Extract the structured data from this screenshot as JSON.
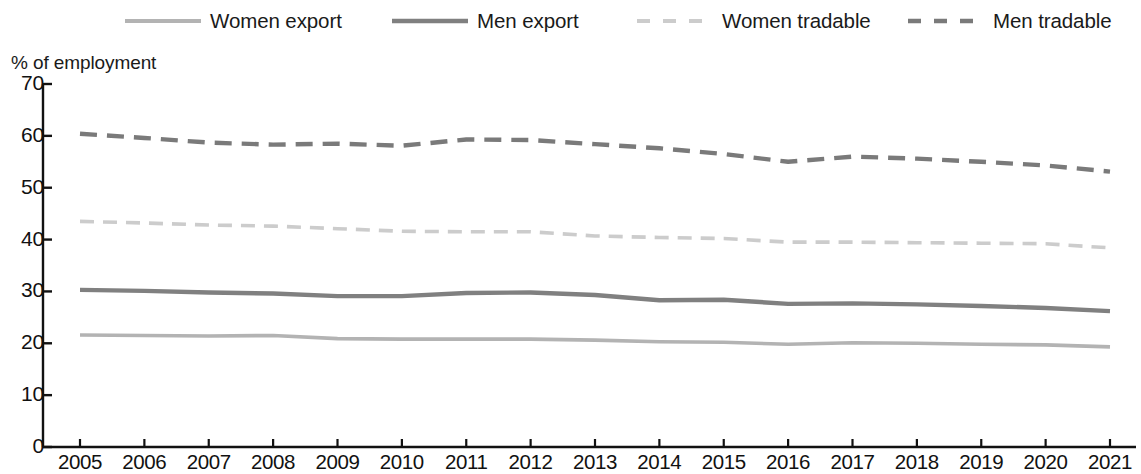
{
  "chart_data": {
    "type": "line",
    "title": "",
    "subtitle": "",
    "ylabel": "% of employment",
    "xlabel": "",
    "ylim": [
      0,
      70
    ],
    "yticks": [
      0,
      10,
      20,
      30,
      40,
      50,
      60,
      70
    ],
    "grid": false,
    "legend_position": "top",
    "x": [
      2005,
      2006,
      2007,
      2008,
      2009,
      2010,
      2011,
      2012,
      2013,
      2014,
      2015,
      2016,
      2017,
      2018,
      2019,
      2020,
      2021
    ],
    "categories": [
      "2005",
      "2006",
      "2007",
      "2008",
      "2009",
      "2010",
      "2011",
      "2012",
      "2013",
      "2014",
      "2015",
      "2016",
      "2017",
      "2018",
      "2019",
      "2020",
      "2021"
    ],
    "series": [
      {
        "name": "Women export",
        "style": "solid",
        "color": "#b3b3b3",
        "values": [
          21.6,
          21.5,
          21.4,
          21.5,
          20.9,
          20.8,
          20.8,
          20.8,
          20.6,
          20.3,
          20.2,
          19.8,
          20.1,
          20.0,
          19.8,
          19.7,
          19.3
        ]
      },
      {
        "name": "Men export",
        "style": "solid",
        "color": "#808080",
        "values": [
          30.3,
          30.1,
          29.8,
          29.6,
          29.1,
          29.1,
          29.7,
          29.8,
          29.3,
          28.3,
          28.4,
          27.6,
          27.7,
          27.5,
          27.2,
          26.8,
          26.2
        ]
      },
      {
        "name": "Women tradable",
        "style": "dashed",
        "color": "#cccccc",
        "values": [
          43.5,
          43.2,
          42.8,
          42.6,
          42.1,
          41.6,
          41.5,
          41.5,
          40.7,
          40.4,
          40.2,
          39.5,
          39.5,
          39.4,
          39.3,
          39.2,
          38.4
        ]
      },
      {
        "name": "Men tradable",
        "style": "dashed",
        "color": "#7a7a7a",
        "values": [
          60.4,
          59.6,
          58.7,
          58.3,
          58.5,
          58.1,
          59.3,
          59.2,
          58.4,
          57.6,
          56.5,
          55.0,
          56.0,
          55.6,
          55.0,
          54.3,
          53.1
        ]
      }
    ]
  },
  "legend": {
    "items": [
      {
        "label": "Women export"
      },
      {
        "label": "Men export"
      },
      {
        "label": "Women tradable"
      },
      {
        "label": "Men tradable"
      }
    ]
  },
  "axes": {
    "y_title": "% of employment",
    "y_labels": [
      "70",
      "60",
      "50",
      "40",
      "30",
      "20",
      "10",
      "0"
    ],
    "x_labels": [
      "2005",
      "2006",
      "2007",
      "2008",
      "2009",
      "2010",
      "2011",
      "2012",
      "2013",
      "2014",
      "2015",
      "2016",
      "2017",
      "2018",
      "2019",
      "2020",
      "2021"
    ]
  }
}
